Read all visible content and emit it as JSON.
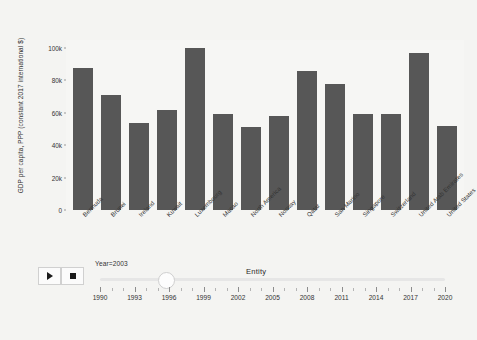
{
  "chart_data": {
    "type": "bar",
    "title": "",
    "xlabel": "Entity",
    "ylabel": "GDP per capita, PPP (constant 2017 international $)",
    "categories": [
      "Bermuda",
      "Brunei",
      "Ireland",
      "Kuwait",
      "Luxembourg",
      "Macao",
      "North America",
      "Norway",
      "Qatar",
      "San Marino",
      "Singapore",
      "Switzerland",
      "United Arab Emirates",
      "United States"
    ],
    "values": [
      88000,
      71000,
      54000,
      62000,
      100000,
      59000,
      51000,
      58000,
      86000,
      78000,
      59000,
      59000,
      97000,
      52000
    ],
    "ylim": [
      0,
      105000
    ],
    "yticks": [
      0,
      20000,
      40000,
      60000,
      80000,
      100000
    ],
    "ytick_labels": [
      "0",
      "20k",
      "40k",
      "60k",
      "80k",
      "100k"
    ],
    "grid": false,
    "legend": "none",
    "bar_color": "#575757",
    "plot_background": "#f6f6f4"
  },
  "controls": {
    "play_label": "▶",
    "stop_label": "■",
    "year_label": "Year=2003",
    "entity_label": "Entity",
    "slider": {
      "min": 1990,
      "max": 2021,
      "value": 2003,
      "tick_labels": [
        "1990",
        "1993",
        "1996",
        "1999",
        "2002",
        "2005",
        "2008",
        "2011",
        "2014",
        "2017",
        "2020"
      ]
    }
  }
}
